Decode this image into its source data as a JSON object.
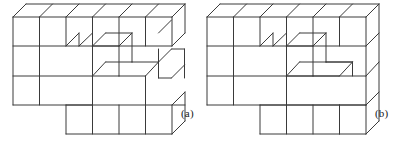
{
  "figure": {
    "caption_a": "(a)",
    "caption_b": "(b)",
    "stroke_color": "#3a3a3a",
    "background_color": "#ffffff",
    "geometry": {
      "cube_width": 26.5,
      "cube_height": 29.4,
      "depth_dx": 13.0,
      "depth_dy": -13.0,
      "columns": 6,
      "rows": 3
    },
    "panel_a": {
      "label": "(a)",
      "origin_x": 13,
      "origin_y": 105,
      "notes": "Top row of 6 cubes full width; middle row has a two-cube-wide recess; bottom row is a shorter slab of 4 cubes offset to the right",
      "lines": [
        [
          13,
          17,
          172,
          17
        ],
        [
          13,
          46,
          172,
          46
        ],
        [
          13,
          76,
          92,
          76
        ],
        [
          13,
          105,
          92,
          105
        ],
        [
          13,
          17,
          13,
          105
        ],
        [
          39.5,
          17,
          39.5,
          105
        ],
        [
          66,
          17,
          66,
          46
        ],
        [
          92.5,
          17,
          92.5,
          105
        ],
        [
          119,
          17,
          119,
          46
        ],
        [
          145.5,
          17,
          145.5,
          46
        ],
        [
          172,
          17,
          172,
          46
        ],
        [
          13,
          17,
          26,
          4
        ],
        [
          39.5,
          17,
          52.5,
          4
        ],
        [
          66,
          17,
          79,
          4
        ],
        [
          92.5,
          17,
          105.5,
          4
        ],
        [
          119,
          17,
          132,
          4
        ],
        [
          145.5,
          17,
          158.5,
          4
        ],
        [
          172,
          17,
          185,
          4
        ],
        [
          26,
          4,
          185,
          4
        ],
        [
          185,
          4,
          185,
          33
        ],
        [
          172,
          46,
          185,
          33
        ],
        [
          66,
          46,
          79,
          33
        ],
        [
          79,
          33,
          79,
          46
        ],
        [
          79,
          46,
          92.5,
          33
        ],
        [
          92.5,
          46,
          119,
          46
        ],
        [
          92.5,
          46,
          105.5,
          33
        ],
        [
          105.5,
          33,
          132,
          33
        ],
        [
          132,
          33,
          132,
          62
        ],
        [
          119,
          46,
          132,
          33
        ],
        [
          119,
          46,
          119,
          76
        ],
        [
          92.5,
          76,
          119,
          76
        ],
        [
          92.5,
          76,
          105.5,
          62
        ],
        [
          105.5,
          62,
          132,
          62
        ],
        [
          132,
          62,
          158.5,
          62
        ],
        [
          145.5,
          76,
          158.5,
          62
        ],
        [
          145.5,
          76,
          145.5,
          105
        ],
        [
          119,
          76,
          145.5,
          76
        ],
        [
          158.5,
          62,
          171.5,
          49
        ],
        [
          171.5,
          49,
          184.5,
          49
        ],
        [
          158.5,
          33,
          171.5,
          20
        ],
        [
          66,
          105,
          185,
          105
        ],
        [
          66,
          105,
          66,
          134
        ],
        [
          66,
          134,
          172,
          134
        ],
        [
          172,
          134,
          172,
          105
        ],
        [
          92.5,
          105,
          92.5,
          134
        ],
        [
          119,
          105,
          119,
          134
        ],
        [
          145.5,
          105,
          145.5,
          134
        ],
        [
          172,
          105,
          185,
          92
        ],
        [
          185,
          92,
          185,
          121
        ],
        [
          172,
          134,
          185,
          121
        ],
        [
          158.5,
          49,
          158.5,
          78
        ],
        [
          184.5,
          49,
          184.5,
          78
        ],
        [
          158.5,
          78,
          171.5,
          78
        ],
        [
          171.5,
          78,
          184.5,
          65
        ]
      ]
    },
    "panel_b": {
      "label": "(b)",
      "origin_x": 207,
      "origin_y": 105,
      "notes": "Full 3-row by 6-column block with a recessed notch carved into the middle-left region",
      "lines": [
        [
          207,
          17,
          366,
          17
        ],
        [
          207,
          46,
          366,
          46
        ],
        [
          207,
          76,
          366,
          76
        ],
        [
          207,
          105,
          366,
          105
        ],
        [
          207,
          17,
          207,
          105
        ],
        [
          233.5,
          17,
          233.5,
          105
        ],
        [
          260,
          17,
          260,
          46
        ],
        [
          286.5,
          17,
          286.5,
          105
        ],
        [
          313,
          17,
          313,
          46
        ],
        [
          339.5,
          17,
          339.5,
          46
        ],
        [
          366,
          17,
          366,
          105
        ],
        [
          207,
          17,
          220,
          4
        ],
        [
          233.5,
          17,
          246.5,
          4
        ],
        [
          260,
          17,
          273,
          4
        ],
        [
          286.5,
          17,
          299.5,
          4
        ],
        [
          313,
          17,
          326,
          4
        ],
        [
          339.5,
          17,
          352.5,
          4
        ],
        [
          366,
          17,
          379,
          4
        ],
        [
          220,
          4,
          379,
          4
        ],
        [
          379,
          4,
          379,
          121
        ],
        [
          366,
          46,
          379,
          33
        ],
        [
          366,
          76,
          379,
          62
        ],
        [
          366,
          105,
          379,
          92
        ],
        [
          260,
          46,
          273,
          33
        ],
        [
          273,
          33,
          273,
          46
        ],
        [
          273,
          46,
          286.5,
          33
        ],
        [
          286.5,
          46,
          313,
          46
        ],
        [
          286.5,
          46,
          299.5,
          33
        ],
        [
          299.5,
          33,
          326,
          33
        ],
        [
          326,
          33,
          326,
          62
        ],
        [
          313,
          46,
          326,
          33
        ],
        [
          313,
          46,
          313,
          76
        ],
        [
          286.5,
          76,
          313,
          76
        ],
        [
          286.5,
          76,
          299.5,
          62
        ],
        [
          299.5,
          62,
          326,
          62
        ],
        [
          326,
          62,
          352.5,
          62
        ],
        [
          339.5,
          76,
          352.5,
          62
        ],
        [
          313,
          76,
          339.5,
          76
        ],
        [
          260,
          105,
          366,
          105
        ],
        [
          260,
          105,
          260,
          134
        ],
        [
          260,
          134,
          366,
          134
        ],
        [
          366,
          134,
          366,
          105
        ],
        [
          286.5,
          105,
          286.5,
          134
        ],
        [
          313,
          105,
          313,
          134
        ],
        [
          339.5,
          105,
          339.5,
          134
        ],
        [
          366,
          134,
          379,
          121
        ],
        [
          326,
          62,
          352.5,
          62
        ],
        [
          352.5,
          62,
          352.5,
          76
        ],
        [
          339.5,
          105,
          339.5,
          134
        ]
      ]
    }
  }
}
